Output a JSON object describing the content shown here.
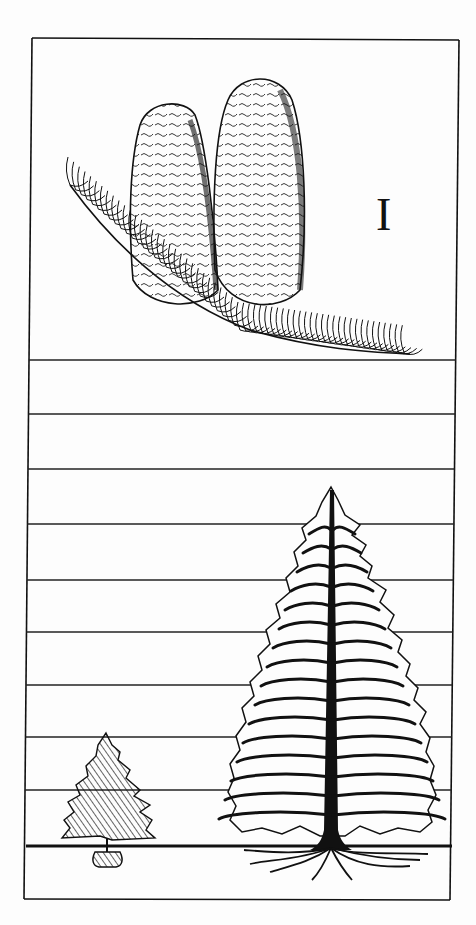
{
  "plate": {
    "numeral": "I",
    "numeral_pos": {
      "x": 376,
      "y": 192
    },
    "colors": {
      "ink": "#111111",
      "paper": "#fdfdfd"
    },
    "frame": {
      "top_left": [
        32,
        38
      ],
      "top_right": [
        459,
        40
      ],
      "bottom_left": [
        24,
        899
      ],
      "bottom_right": [
        450,
        900
      ]
    },
    "scale_lines_y": [
      360,
      414,
      469,
      524,
      580,
      632,
      685,
      737,
      790
    ],
    "ground_line_y": 846,
    "panels": {
      "top": "two cones on needled branch",
      "bottom": "size comparison: young tree with root ball vs mature tree with roots"
    }
  }
}
